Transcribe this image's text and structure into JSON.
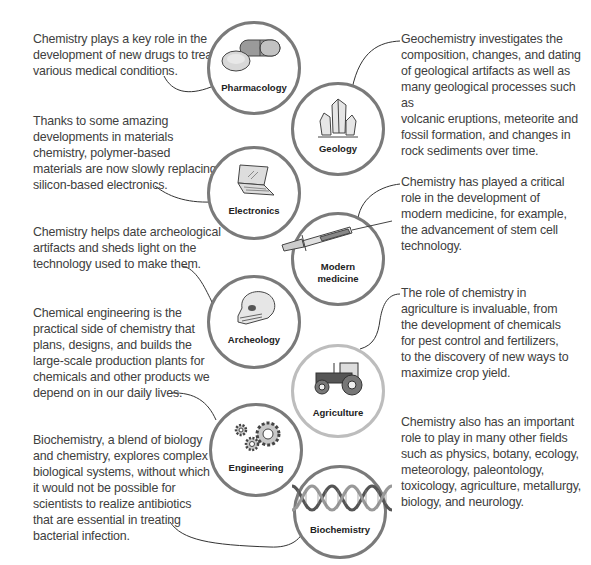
{
  "colors": {
    "circle_border": "#7a7a7a",
    "circle_border_light": "#bdbdbd",
    "text": "#404040",
    "label": "#222222"
  },
  "nodes": [
    {
      "id": "pharmacology",
      "label": "Pharmacology",
      "icon": "pill-capsule-icon",
      "description": "Chemistry plays a key role in the development of new drugs to treat various medical conditions."
    },
    {
      "id": "geology",
      "label": "Geology",
      "icon": "crystal-icon",
      "description": "Geochemistry investigates the composition, changes, and dating of geological artifacts as well as many geological processes such as volcanic eruptions, meteorite and fossil formation, and changes in rock sediments over time."
    },
    {
      "id": "electronics",
      "label": "Electronics",
      "icon": "laptop-icon",
      "description": "Thanks to some amazing developments in materials chemistry, polymer-based materials are now slowly replacing silicon-based electronics."
    },
    {
      "id": "modern-medicine",
      "label_line1": "Modern",
      "label_line2": "medicine",
      "icon": "syringe-icon",
      "description": "Chemistry has played a critical role in the development of modern medicine, for example, the advancement of stem cell technology."
    },
    {
      "id": "archeology",
      "label": "Archeology",
      "icon": "skull-icon",
      "description": "Chemistry helps date archeological artifacts and sheds light on the technology used to make them."
    },
    {
      "id": "agriculture",
      "label": "Agriculture",
      "icon": "tractor-icon",
      "description": "The  role of chemistry in agriculture is invaluable, from the development of chemicals for pest control and fertilizers, to the discovery of new ways to maximize crop yield."
    },
    {
      "id": "engineering",
      "label": "Engineering",
      "icon": "gears-icon",
      "description": "Chemical engineering is the practical side of chemistry that plans, designs, and builds the large-scale production plants for chemicals and other products we depend on in our daily lives."
    },
    {
      "id": "biochemistry",
      "label": "Biochemistry",
      "icon": "dna-helix-icon",
      "description": "Biochemistry, a blend of biology and chemistry, explores complex biological systems, without which it would not be possible for scientists to realize antibiotics that are essential in treating bacterial infection."
    }
  ],
  "other_fields": "Chemistry also has an important role to play in many other fields such as physics, botany, ecology, meteorology,  paleontology, toxicology,  agriculture, metallurgy, biology, and neurology.",
  "text_lines": {
    "pharmacology": [
      "Chemistry plays a key role in the",
      "development of new drugs to treat",
      "various medical conditions."
    ],
    "geology": [
      "Geochemistry investigates the",
      "composition, changes, and dating",
      "of geological artifacts as well as",
      "many geological processes such as",
      "volcanic eruptions, meteorite and",
      "fossil formation, and changes in",
      "rock sediments over time."
    ],
    "electronics": [
      "Thanks to some amazing",
      "developments in materials",
      "chemistry, polymer-based",
      "materials are now slowly replacing",
      "silicon-based electronics."
    ],
    "modern_medicine": [
      "Chemistry has played a critical",
      "role in the development of",
      "modern medicine, for example,",
      "the advancement of stem cell",
      "technology."
    ],
    "archeology": [
      "Chemistry helps date archeological",
      "artifacts and sheds light on the",
      "technology used to make them."
    ],
    "agriculture": [
      "The  role of chemistry in",
      "agriculture is invaluable, from",
      "the development of chemicals",
      "for pest control and fertilizers,",
      "to the discovery of new ways to",
      "maximize crop yield."
    ],
    "engineering": [
      "Chemical engineering is the",
      "practical side of chemistry that",
      "plans, designs, and builds the",
      "large-scale production plants for",
      "chemicals and other products we",
      "depend on in our daily lives."
    ],
    "biochemistry": [
      "Biochemistry, a blend of biology",
      "and chemistry, explores complex",
      "biological systems, without which",
      "it would not be possible for",
      "scientists to realize antibiotics",
      "that are essential in treating",
      "bacterial infection."
    ],
    "other_fields": [
      "Chemistry also has an important",
      "role to play in many other fields",
      "such as physics, botany, ecology,",
      "meteorology,  paleontology,",
      "toxicology,  agriculture, metallurgy,",
      "biology, and neurology."
    ]
  }
}
